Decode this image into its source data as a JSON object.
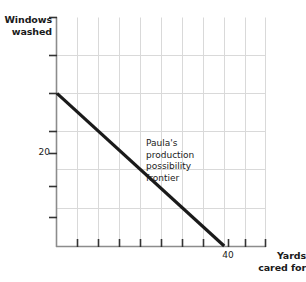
{
  "chart_data": {
    "type": "line",
    "title": "",
    "subtitle": "",
    "xlabel": "Yards cared for",
    "ylabel": "Windows washed",
    "xlim": [
      0,
      50
    ],
    "ylim": [
      0,
      30
    ],
    "grid": true,
    "legend": null,
    "x_ticks": [
      0,
      5,
      10,
      15,
      20,
      25,
      30,
      35,
      40,
      45,
      50
    ],
    "y_ticks": [
      0,
      5,
      10,
      15,
      20,
      25,
      30
    ],
    "x_tick_labels": [
      "",
      "",
      "",
      "",
      "",
      "",
      "",
      "",
      "40",
      "",
      ""
    ],
    "y_tick_labels": [
      "",
      "",
      "",
      "",
      "20",
      "",
      ""
    ],
    "series": [
      {
        "name": "Paula's production possibility frontier",
        "x": [
          0,
          40
        ],
        "y": [
          20,
          0
        ],
        "color": "#1a1a1a",
        "linewidth": 3
      }
    ],
    "annotations": [
      {
        "text": "Paula's\nproduction\npossibility\nfrontier",
        "x": 18,
        "y": 15
      }
    ],
    "grid_color": "#d9d9d9",
    "axis_color": "#8c8c8c",
    "tick_color": "#333333"
  },
  "axes": {
    "y_title": "Windows\nwashed",
    "x_title": "Yards\ncared for",
    "y_value_label": "20",
    "x_value_label": "40"
  },
  "annotation": {
    "text": "Paula's\nproduction\npossibility\nfrontier"
  }
}
